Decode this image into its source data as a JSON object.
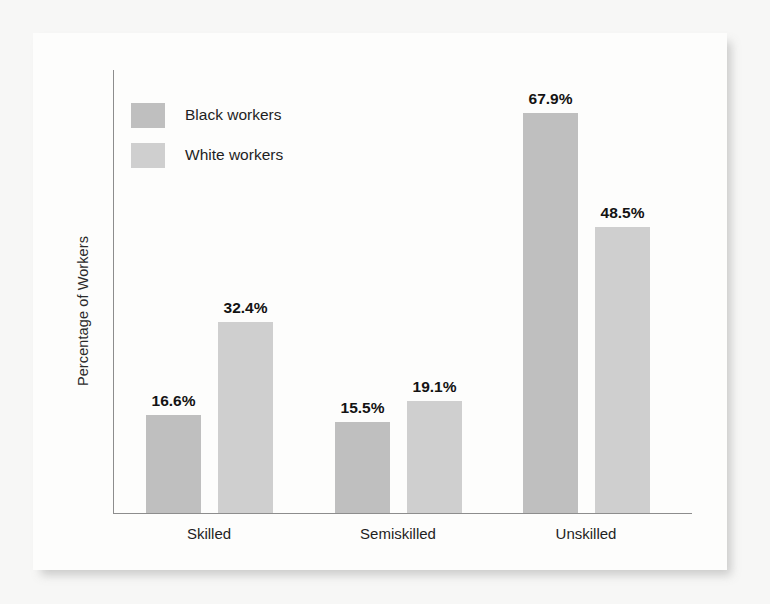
{
  "chart_data": {
    "type": "bar",
    "title": "",
    "subtitle": "",
    "xlabel": "",
    "ylabel": "Percentage of Workers",
    "categories": [
      "Skilled",
      "Semiskilled",
      "Unskilled"
    ],
    "series": [
      {
        "name": "Black workers",
        "color": "#bfbfbf",
        "values": [
          16.6,
          67.9,
          15.5
        ],
        "value_labels": [
          "16.6%",
          "15.5%",
          "67.9%"
        ]
      },
      {
        "name": "White workers",
        "color": "#cfcfcf",
        "values": [
          32.4,
          19.1,
          48.5
        ],
        "value_labels": [
          "32.4%",
          "19.1%",
          "48.5%"
        ]
      }
    ],
    "points": [
      {
        "category": "Skilled",
        "series": "Black workers",
        "value": 16.6,
        "label": "16.6%"
      },
      {
        "category": "Skilled",
        "series": "White workers",
        "value": 32.4,
        "label": "32.4%"
      },
      {
        "category": "Semiskilled",
        "series": "Black workers",
        "value": 15.5,
        "label": "15.5%"
      },
      {
        "category": "Semiskilled",
        "series": "White workers",
        "value": 19.1,
        "label": "19.1%"
      },
      {
        "category": "Unskilled",
        "series": "Black workers",
        "value": 67.9,
        "label": "67.9%"
      },
      {
        "category": "Unskilled",
        "series": "White workers",
        "value": 48.5,
        "label": "48.5%"
      }
    ],
    "ylim": [
      0,
      72
    ],
    "grid": false,
    "legend_position": "top-left",
    "axis_tick_labels_y": [],
    "value_labels_shown": true
  },
  "legend": {
    "items": [
      {
        "label": "Black workers",
        "color": "#bfbfbf"
      },
      {
        "label": "White workers",
        "color": "#cfcfcf"
      }
    ]
  },
  "axes": {
    "y_title": "Percentage of Workers",
    "categories": [
      "Skilled",
      "Semiskilled",
      "Unskilled"
    ]
  },
  "colors": {
    "black_workers_bar": "#bfbfbf",
    "white_workers_bar": "#cfcfcf",
    "axis_line": "#8d8d8d",
    "text": "#1f1f1f",
    "card_background": "#fdfdfc",
    "page_background": "#f7f7f6"
  }
}
